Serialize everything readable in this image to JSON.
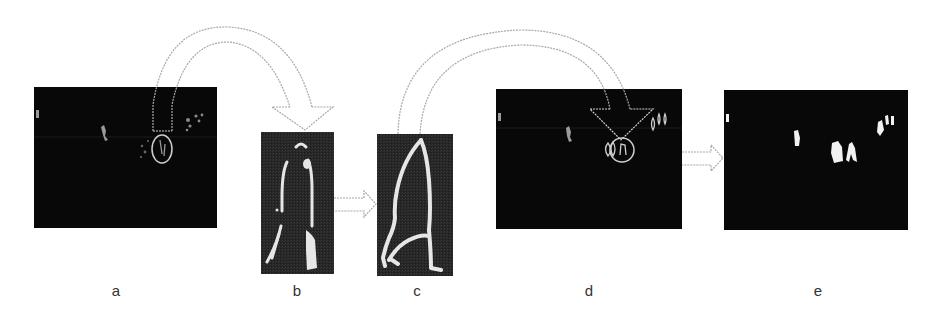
{
  "figure": {
    "type": "image-processing pipeline diagram",
    "panels": [
      {
        "id": "a",
        "label": "a",
        "content": "binary foreground mask frame with detected person circled",
        "x": 34,
        "y": 87,
        "w": 183,
        "h": 141
      },
      {
        "id": "b",
        "label": "b",
        "content": "zoomed silhouette edge outline (walking person)",
        "x": 261,
        "y": 132,
        "w": 73,
        "h": 142
      },
      {
        "id": "c",
        "label": "c",
        "content": "refined closed contour of silhouette",
        "x": 377,
        "y": 134,
        "w": 76,
        "h": 142
      },
      {
        "id": "d",
        "label": "d",
        "content": "frame with refined contour placed back and circled",
        "x": 496,
        "y": 89,
        "w": 186,
        "h": 140
      },
      {
        "id": "e",
        "label": "e",
        "content": "final filled foreground blobs",
        "x": 724,
        "y": 90,
        "w": 184,
        "h": 140
      }
    ],
    "arrows": [
      {
        "from": "a",
        "to": "b",
        "style": "curved-hollow-dotted"
      },
      {
        "from": "b",
        "to": "c",
        "style": "straight-hollow-dotted"
      },
      {
        "from": "c",
        "to": "d",
        "style": "curved-hollow-dotted"
      },
      {
        "from": "d",
        "to": "e",
        "style": "straight-hollow-dotted"
      }
    ],
    "colors": {
      "background": "#ffffff",
      "panel_bg": "#0a0a0a",
      "panel_bg_zoom": "#2a2a2a",
      "foreground": "#e8e8e8",
      "arrow_stroke": "#a8a8a8",
      "label": "#333333"
    }
  }
}
